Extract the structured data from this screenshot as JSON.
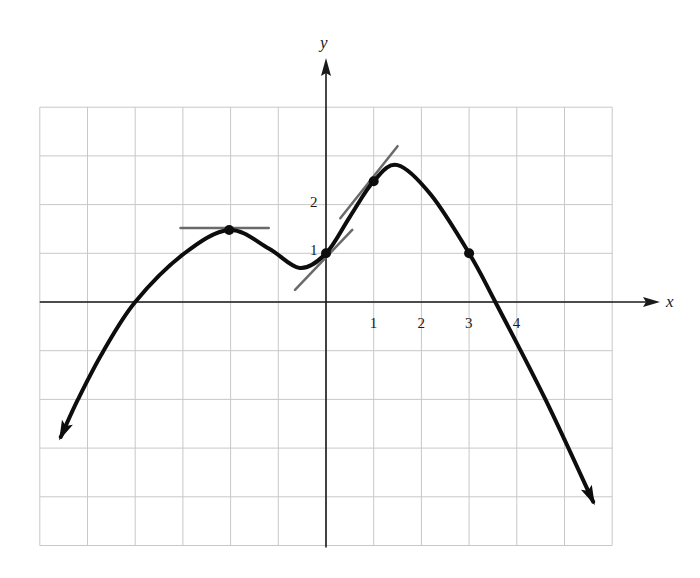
{
  "chart_data": {
    "type": "line",
    "title": "",
    "xlabel": "x",
    "ylabel": "y",
    "xlim": [
      -6,
      6
    ],
    "ylim": [
      -5,
      4
    ],
    "grid": true,
    "legend": null,
    "x_tick_labels": [
      {
        "value": 1,
        "label": "1"
      },
      {
        "value": 2,
        "label": "2"
      },
      {
        "value": 3,
        "label": "3"
      },
      {
        "value": 4,
        "label": "4"
      }
    ],
    "y_tick_labels": [
      {
        "value": 1,
        "label": "1"
      },
      {
        "value": 2,
        "label": "2"
      }
    ],
    "series": [
      {
        "name": "f(x)",
        "arrows_at_ends": true,
        "points": [
          [
            -5.56,
            -2.77
          ],
          [
            -5.2,
            -2.0
          ],
          [
            -4.68,
            -1.03
          ],
          [
            -4.0,
            0.0
          ],
          [
            -2.98,
            0.99
          ],
          [
            -2.03,
            1.48
          ],
          [
            -1.2,
            1.1
          ],
          [
            -0.55,
            0.7
          ],
          [
            0.0,
            1.0
          ],
          [
            0.5,
            1.75
          ],
          [
            1.0,
            2.48
          ],
          [
            1.5,
            2.81
          ],
          [
            2.2,
            2.2
          ],
          [
            3.0,
            1.0
          ],
          [
            3.55,
            0.0
          ],
          [
            4.6,
            -2.0
          ],
          [
            5.6,
            -4.1
          ]
        ]
      }
    ],
    "marked_points": [
      {
        "x": -2.03,
        "y": 1.48,
        "label": "local maximum"
      },
      {
        "x": 0,
        "y": 1,
        "label": "(0, 1)"
      },
      {
        "x": 1,
        "y": 2.48,
        "label": "(1, f(1))"
      },
      {
        "x": 3,
        "y": 1,
        "label": "(3, 1)"
      }
    ],
    "tangent_lines": [
      {
        "at_x": -2.03,
        "from": [
          -3.05,
          1.52
        ],
        "to": [
          -1.2,
          1.52
        ],
        "slope": 0
      },
      {
        "at_x": 0,
        "from": [
          -0.65,
          0.25
        ],
        "to": [
          0.55,
          1.48
        ],
        "slope": 1.0
      },
      {
        "at_x": 1,
        "from": [
          0.3,
          1.72
        ],
        "to": [
          1.5,
          3.2
        ],
        "slope": 1.3
      }
    ]
  },
  "view": {
    "origin_px": [
      326,
      302
    ],
    "unit_px": [
      47.7,
      48.7
    ],
    "grid_x_range": [
      -6,
      6
    ],
    "grid_y_range": [
      -5,
      4
    ]
  }
}
